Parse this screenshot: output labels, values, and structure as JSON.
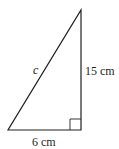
{
  "diagram": {
    "type": "right-triangle",
    "vertices": {
      "bottom_left": [
        8,
        130
      ],
      "bottom_right": [
        81,
        130
      ],
      "top": [
        81,
        10
      ]
    },
    "right_angle_at": "bottom_right",
    "labels": {
      "hypotenuse": "c",
      "vertical_side": "15 cm",
      "base": "6 cm"
    },
    "stroke_color": "#231f20"
  }
}
